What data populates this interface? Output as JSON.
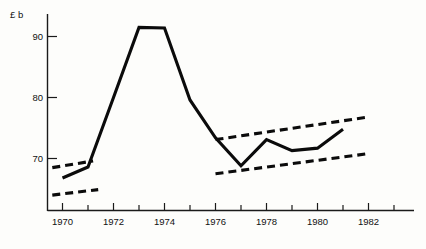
{
  "chart_data": {
    "type": "line",
    "title": "",
    "subtitle": "",
    "xlabel": "",
    "ylabel": "",
    "unit_label": "£ b",
    "grid": false,
    "legend": "none",
    "xlim": [
      1969,
      1982
    ],
    "ylim": [
      63,
      93
    ],
    "y_ticks": [
      70,
      80,
      90
    ],
    "y_tick_labels": [
      "70",
      "80",
      "90"
    ],
    "x_ticks": [
      1970,
      1971,
      1972,
      1973,
      1974,
      1975,
      1976,
      1977,
      1978,
      1979,
      1980,
      1981,
      1982
    ],
    "x_tick_labels": [
      "1970",
      "",
      "1972",
      "",
      "1974",
      "",
      "1976",
      "",
      "1978",
      "",
      "1980",
      "",
      "1982"
    ],
    "x_labeled_ticks": [
      1970,
      1972,
      1974,
      1976,
      1978,
      1980,
      1982
    ],
    "series": [
      {
        "name": "main",
        "style": "solid",
        "x": [
          1970,
          1971,
          1972,
          1973,
          1974,
          1975,
          1976,
          1977,
          1978,
          1979,
          1980,
          1981
        ],
        "values": [
          66.8,
          68.6,
          80.0,
          91.5,
          91.4,
          79.6,
          73.4,
          68.8,
          73.1,
          71.3,
          71.7,
          74.8
        ]
      },
      {
        "name": "early-trend-upper",
        "style": "dashed",
        "x": [
          1969.6,
          1971.2
        ],
        "values": [
          68.5,
          69.6
        ]
      },
      {
        "name": "early-trend-lower",
        "style": "dashed",
        "x": [
          1969.6,
          1971.4
        ],
        "values": [
          64.0,
          64.9
        ]
      },
      {
        "name": "late-trend-upper",
        "style": "dashed",
        "x": [
          1976.0,
          1982.0
        ],
        "values": [
          73.1,
          76.8
        ]
      },
      {
        "name": "late-trend-lower",
        "style": "dashed",
        "x": [
          1976.0,
          1982.0
        ],
        "values": [
          67.5,
          70.8
        ]
      }
    ]
  },
  "axes": {
    "y_unit": "£ b",
    "y_tick_values": [
      "90",
      "80",
      "70"
    ],
    "x_tick_values": [
      "1970",
      "1972",
      "1974",
      "1976",
      "1978",
      "1980",
      "1982"
    ]
  },
  "colors": {
    "ink": "#0b0b0b",
    "axis": "#1a1a1a",
    "paper": "#fdfdfb"
  }
}
